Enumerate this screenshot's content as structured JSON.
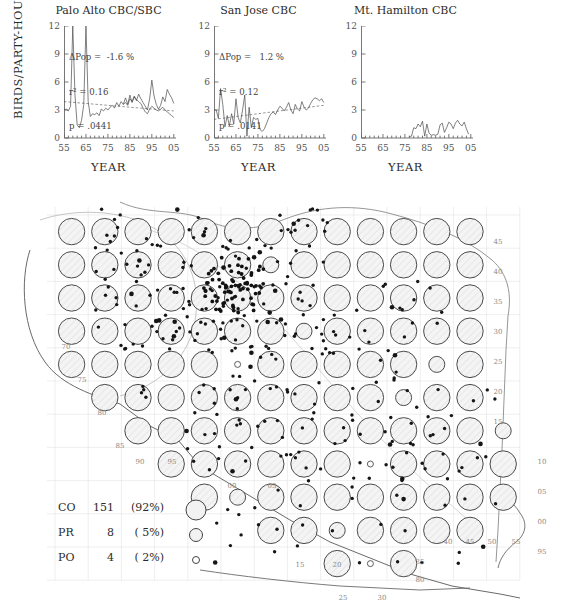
{
  "figure": {
    "axis_y_label": "BIRDS/PARTY-HOUR",
    "axis_x_label": "YEAR"
  },
  "chart_data": [
    {
      "type": "line",
      "title": "Palo Alto CBC/SBC",
      "xlabel": "YEAR",
      "ylabel": "BIRDS/PARTY-HOUR",
      "xlim": [
        55,
        106
      ],
      "ylim": [
        0,
        12
      ],
      "yticks": [
        0,
        3,
        6,
        9,
        12
      ],
      "xticks": [
        "55",
        "65",
        "75",
        "85",
        "95",
        "05"
      ],
      "grid": false,
      "annotations": {
        "delta_pop": "ΔPop =  -1.6 %",
        "r_squared": "r² = 0.16",
        "p_value": "p = .0441"
      },
      "x": [
        55,
        56,
        57,
        58,
        59,
        60,
        61,
        62,
        63,
        64,
        65,
        66,
        67,
        68,
        69,
        70,
        71,
        72,
        73,
        74,
        75,
        76,
        77,
        78,
        79,
        80,
        81,
        82,
        83,
        84,
        85,
        86,
        87,
        88,
        89,
        90,
        91,
        92,
        93,
        94,
        95,
        96,
        97,
        98,
        99,
        100,
        101,
        102,
        103,
        104,
        105
      ],
      "series": [
        {
          "name": "Palo Alto CBC",
          "values": [
            3.0,
            3.1,
            2.9,
            3.4,
            12.0,
            4.6,
            1.4,
            1.1,
            1.9,
            3.6,
            12.0,
            3.9,
            2.3,
            2.6,
            2.5,
            2.7,
            2.4,
            3.1,
            2.9,
            3.2,
            3.0,
            3.3,
            3.5,
            3.2,
            3.8,
            3.4,
            3.9,
            3.6,
            4.3,
            3.6,
            4.6,
            3.8,
            4.4,
            4.0,
            4.7,
            4.2,
            3.8,
            3.4,
            3.0,
            4.2,
            6.2,
            4.5,
            3.6,
            3.1,
            3.5,
            4.4,
            3.9,
            5.2,
            4.7,
            4.3,
            3.7
          ]
        },
        {
          "name": "Palo Alto SBC",
          "values": [
            null,
            null,
            null,
            null,
            null,
            null,
            null,
            null,
            null,
            null,
            null,
            null,
            null,
            null,
            null,
            null,
            null,
            null,
            null,
            null,
            null,
            null,
            null,
            null,
            null,
            null,
            null,
            3.6,
            3.8,
            3.5,
            4.2,
            3.9,
            4.5,
            4.1,
            3.9,
            3.7,
            3.2,
            2.8,
            2.6,
            3.1,
            3.4,
            3.2,
            3.0,
            2.9,
            3.1,
            3.3,
            3.0,
            2.8,
            2.6,
            2.4,
            2.2
          ]
        },
        {
          "name": "trend",
          "style": "dashed",
          "values": [
            3.9,
            3.88,
            3.86,
            3.84,
            3.82,
            3.8,
            3.78,
            3.76,
            3.74,
            3.72,
            3.7,
            3.68,
            3.66,
            3.64,
            3.62,
            3.6,
            3.58,
            3.56,
            3.54,
            3.52,
            3.5,
            3.48,
            3.46,
            3.44,
            3.42,
            3.4,
            3.38,
            3.36,
            3.34,
            3.32,
            3.3,
            3.28,
            3.26,
            3.24,
            3.22,
            3.2,
            3.18,
            3.16,
            3.14,
            3.12,
            3.1,
            3.08,
            3.06,
            3.04,
            3.02,
            3.0,
            2.98,
            2.96,
            2.94,
            2.92,
            2.9
          ]
        }
      ]
    },
    {
      "type": "line",
      "title": "San Jose CBC",
      "xlabel": "YEAR",
      "ylabel": "BIRDS/PARTY-HOUR",
      "xlim": [
        55,
        106
      ],
      "ylim": [
        0,
        12
      ],
      "yticks": [
        0,
        3,
        6,
        9,
        12
      ],
      "xticks": [
        "55",
        "65",
        "75",
        "85",
        "95",
        "05"
      ],
      "grid": false,
      "annotations": {
        "delta_pop": "ΔPop =   1.2 %",
        "r_squared": "r² = 0.12",
        "p_value": "p = .0141"
      },
      "x": [
        55,
        56,
        57,
        58,
        59,
        60,
        61,
        62,
        63,
        64,
        65,
        66,
        67,
        68,
        69,
        70,
        71,
        72,
        73,
        74,
        75,
        76,
        77,
        78,
        79,
        80,
        81,
        82,
        83,
        84,
        85,
        86,
        87,
        88,
        89,
        90,
        91,
        92,
        93,
        94,
        95,
        96,
        97,
        98,
        99,
        100,
        101,
        102,
        103,
        104,
        105
      ],
      "series": [
        {
          "name": "San Jose CBC",
          "values": [
            3.0,
            3.0,
            2.1,
            5.3,
            3.6,
            1.2,
            2.4,
            1.3,
            2.6,
            1.5,
            4.2,
            2.2,
            1.6,
            3.0,
            4.6,
            0.2,
            3.3,
            1.1,
            2.2,
            2.0,
            2.1,
            0.9,
            0.7,
            1.0,
            1.6,
            2.2,
            2.6,
            2.8,
            2.5,
            3.0,
            3.4,
            3.2,
            2.9,
            3.3,
            3.8,
            3.0,
            2.6,
            3.6,
            3.1,
            2.9,
            3.9,
            3.3,
            3.0,
            3.2,
            3.7,
            4.1,
            4.3,
            4.2,
            4.0,
            4.2,
            3.8
          ]
        },
        {
          "name": "trend",
          "style": "dashed",
          "values": [
            2.0,
            2.03,
            2.06,
            2.09,
            2.12,
            2.15,
            2.18,
            2.21,
            2.24,
            2.27,
            2.3,
            2.33,
            2.36,
            2.39,
            2.42,
            2.45,
            2.48,
            2.51,
            2.54,
            2.57,
            2.6,
            2.63,
            2.66,
            2.69,
            2.72,
            2.75,
            2.78,
            2.81,
            2.84,
            2.87,
            2.9,
            2.93,
            2.96,
            2.99,
            3.02,
            3.05,
            3.08,
            3.11,
            3.14,
            3.17,
            3.2,
            3.23,
            3.26,
            3.29,
            3.32,
            3.35,
            3.38,
            3.41,
            3.44,
            3.47,
            3.5
          ]
        }
      ]
    },
    {
      "type": "line",
      "title": "Mt. Hamilton CBC",
      "xlabel": "YEAR",
      "ylabel": "BIRDS/PARTY-HOUR",
      "xlim": [
        55,
        106
      ],
      "ylim": [
        0,
        12
      ],
      "yticks": [
        0,
        3,
        6,
        9,
        12
      ],
      "xticks": [
        "55",
        "65",
        "75",
        "85",
        "95",
        "05"
      ],
      "grid": false,
      "annotations": {},
      "x": [
        77,
        78,
        79,
        80,
        81,
        82,
        83,
        84,
        85,
        86,
        87,
        88,
        89,
        90,
        91,
        92,
        93,
        94,
        95,
        96,
        97,
        98,
        99,
        100,
        101,
        102,
        103,
        104
      ],
      "series": [
        {
          "name": "Mt. Hamilton CBC",
          "values": [
            0.15,
            0.2,
            1.1,
            1.0,
            1.5,
            1.2,
            1.8,
            0.2,
            1.5,
            0.5,
            0.3,
            0.35,
            0.3,
            0.4,
            1.4,
            1.6,
            0.6,
            1.1,
            1.7,
            1.5,
            1.0,
            1.6,
            1.9,
            1.5,
            1.3,
            1.7,
            1.0,
            0.4
          ]
        }
      ]
    }
  ],
  "map": {
    "grid_labels_right": [
      "45",
      "40",
      "35",
      "30",
      "25",
      "20",
      "15",
      "10",
      "05",
      "00",
      "95"
    ],
    "grid_labels_left": [
      "70",
      "75",
      "80",
      "85",
      "90",
      "95",
      "00",
      "05"
    ],
    "grid_labels_bottom": [
      "15",
      "20",
      "25",
      "30",
      "35",
      "40",
      "45",
      "50",
      "55",
      "80"
    ]
  },
  "legend": {
    "rows": [
      {
        "code": "CO",
        "count": "151",
        "percent": "(92%)",
        "symbol": "large-circle"
      },
      {
        "code": "PR",
        "count": "8",
        "percent": "( 5%)",
        "symbol": "medium-circle"
      },
      {
        "code": "PO",
        "count": "4",
        "percent": "( 2%)",
        "symbol": "small-circle"
      }
    ]
  }
}
